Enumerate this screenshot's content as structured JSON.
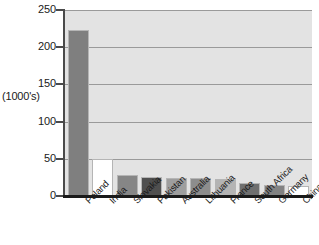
{
  "chart_data": {
    "type": "bar",
    "title": "",
    "xlabel": "",
    "ylabel": "(1000's)",
    "ylim": [
      0,
      250
    ],
    "ytick_labels": [
      "250",
      "200",
      "150",
      "100",
      "50",
      "0"
    ],
    "ytick_values": [
      250,
      200,
      150,
      100,
      50,
      0
    ],
    "grid": true,
    "legend": "none",
    "categories": [
      "Poland",
      "India",
      "Slovakia",
      "Pakistan",
      "Australia",
      "Lithuania",
      "France",
      "South Africa",
      "Germany",
      "China"
    ],
    "values": [
      223,
      50,
      28,
      25,
      24,
      24,
      23,
      17,
      15,
      13
    ],
    "bar_colors": [
      "#7f7f7f",
      "#ffffff",
      "#868686",
      "#4f4f4f",
      "#9e9e9e",
      "#8d8d8d",
      "#b4b4b4",
      "#6f6f6f",
      "#828282",
      "#ffffff"
    ],
    "plot_background": "#e3e3e3",
    "axis_color": "#1a1a1a",
    "gridline_color": "#9a9a9a"
  }
}
